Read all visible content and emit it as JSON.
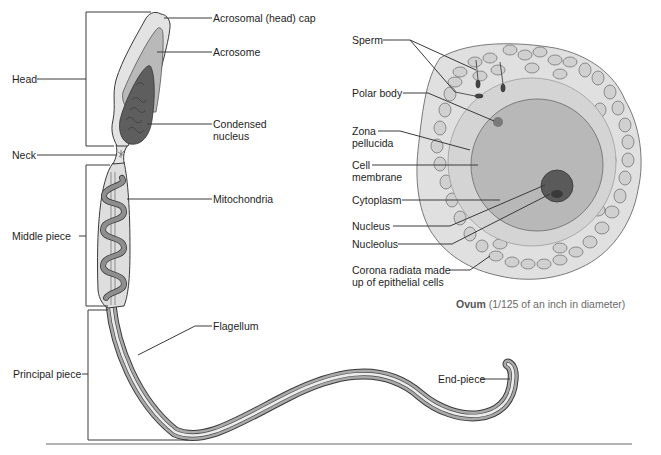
{
  "figure": {
    "sperm": {
      "regions": [
        {
          "id": "head",
          "label": "Head"
        },
        {
          "id": "neck",
          "label": "Neck"
        },
        {
          "id": "middle",
          "label": "Middle piece"
        },
        {
          "id": "principal",
          "label": "Principal piece"
        }
      ],
      "parts": [
        {
          "id": "acrosomal-cap",
          "label": "Acrosomal (head) cap"
        },
        {
          "id": "acrosome",
          "label": "Acrosome"
        },
        {
          "id": "condensed-nucleus",
          "label": "Condensed\nnucleus"
        },
        {
          "id": "mitochondria",
          "label": "Mitochondria"
        },
        {
          "id": "flagellum",
          "label": "Flagellum"
        },
        {
          "id": "end-piece",
          "label": "End-piece"
        }
      ]
    },
    "ovum": {
      "parts": [
        {
          "id": "sperm",
          "label": "Sperm"
        },
        {
          "id": "polar-body",
          "label": "Polar body"
        },
        {
          "id": "zona-pellucida",
          "label": "Zona\npellucida"
        },
        {
          "id": "cell-membrane",
          "label": "Cell\nmembrane"
        },
        {
          "id": "cytoplasm",
          "label": "Cytoplasm"
        },
        {
          "id": "nucleus",
          "label": "Nucleus"
        },
        {
          "id": "nucleolus",
          "label": "Nucleolus"
        },
        {
          "id": "corona-radiata",
          "label": "Corona radiata made\nup of epithelial cells"
        }
      ],
      "caption_bold": "Ovum",
      "caption_rest": " (1/125 of an inch in diameter)"
    },
    "colors": {
      "line": "#3a3a3a",
      "cap": "#e3e3e3",
      "acrosome": "#b9b9b9",
      "nucleus": "#5e5e5e",
      "body": "#dedede",
      "mito": "#8e8e8e",
      "flag_outer": "#a9a9a9",
      "flag_inner": "#e8e8e8",
      "corona": "#e0e0e0",
      "zona": "#d4d4d4",
      "cytoplasm": "#b8b8b8",
      "ovum_nucleus": "#5a5a5a"
    }
  }
}
